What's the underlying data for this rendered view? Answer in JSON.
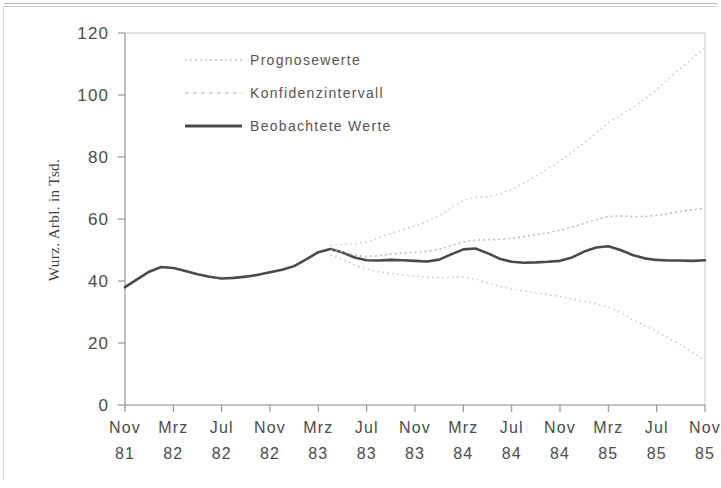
{
  "chart_data": {
    "type": "line",
    "title": "",
    "xlabel": "",
    "ylabel": "Wurz. Arbl. in Tsd.",
    "ylim": [
      0,
      120
    ],
    "yticks": [
      0,
      20,
      40,
      60,
      80,
      100,
      120
    ],
    "ytick_labels": [
      "0",
      "20",
      "40",
      "60",
      "80",
      "100",
      "120"
    ],
    "grid": false,
    "legend_position": "top-left-inside",
    "x_tick_months": [
      "Nov",
      "Mrz",
      "Jul",
      "Nov",
      "Mrz",
      "Jul",
      "Nov",
      "Mrz",
      "Jul",
      "Nov",
      "Mrz",
      "Jul",
      "Nov"
    ],
    "x_tick_years": [
      "81",
      "82",
      "82",
      "82",
      "83",
      "83",
      "83",
      "84",
      "84",
      "84",
      "85",
      "85",
      "85"
    ],
    "x": [
      "Nov 81",
      "Dez 81",
      "Jan 82",
      "Feb 82",
      "Mrz 82",
      "Apr 82",
      "Mai 82",
      "Jun 82",
      "Jul 82",
      "Aug 82",
      "Sep 82",
      "Okt 82",
      "Nov 82",
      "Dez 82",
      "Jan 83",
      "Feb 83",
      "Mrz 83",
      "Apr 83",
      "Mai 83",
      "Jun 83",
      "Jul 83",
      "Aug 83",
      "Sep 83",
      "Okt 83",
      "Nov 83",
      "Dez 83",
      "Jan 84",
      "Feb 84",
      "Mrz 84",
      "Apr 84",
      "Mai 84",
      "Jun 84",
      "Jul 84",
      "Aug 84",
      "Sep 84",
      "Okt 84",
      "Nov 84",
      "Dez 84",
      "Jan 85",
      "Feb 85",
      "Mrz 85",
      "Apr 85",
      "Mai 85",
      "Jun 85",
      "Jul 85",
      "Aug 85",
      "Sep 85",
      "Okt 85",
      "Nov 85"
    ],
    "series": [
      {
        "name": "Beobachtete Werte",
        "style": "solid",
        "color": "#4a4a4a",
        "values": [
          38.0,
          40.5,
          43.0,
          44.5,
          44.2,
          43.2,
          42.2,
          41.4,
          40.8,
          41.0,
          41.4,
          42.0,
          42.8,
          43.6,
          44.8,
          47.0,
          49.3,
          50.3,
          49.2,
          47.6,
          46.7,
          46.6,
          46.8,
          46.7,
          46.5,
          46.3,
          46.9,
          48.6,
          50.2,
          50.5,
          49.0,
          47.2,
          46.2,
          45.9,
          46.0,
          46.2,
          46.5,
          47.6,
          49.5,
          50.8,
          51.2,
          50.0,
          48.4,
          47.3,
          46.8,
          46.6,
          46.6,
          46.5,
          46.7
        ]
      },
      {
        "name": "Prognosewerte",
        "style": "dotted",
        "color": "#b9b9b9",
        "start_index": 17,
        "values": [
          null,
          null,
          null,
          null,
          null,
          null,
          null,
          null,
          null,
          null,
          null,
          null,
          null,
          null,
          null,
          null,
          null,
          50.0,
          49.4,
          48.4,
          47.9,
          48.2,
          48.7,
          49.0,
          49.3,
          49.6,
          50.2,
          51.4,
          52.6,
          53.2,
          53.3,
          53.4,
          53.8,
          54.3,
          54.9,
          55.6,
          56.4,
          57.4,
          58.6,
          59.8,
          60.8,
          61.0,
          60.8,
          60.8,
          61.2,
          61.8,
          62.4,
          63.0,
          63.5
        ]
      },
      {
        "name": "Konfidenzintervall oben",
        "style": "dotted",
        "color": "#c6c6c6",
        "start_index": 17,
        "values": [
          null,
          null,
          null,
          null,
          null,
          null,
          null,
          null,
          null,
          null,
          null,
          null,
          null,
          null,
          null,
          null,
          null,
          51.5,
          51.8,
          52.0,
          52.6,
          54.0,
          55.4,
          56.6,
          57.8,
          59.2,
          61.0,
          63.6,
          66.0,
          67.0,
          67.2,
          68.0,
          69.6,
          71.6,
          73.8,
          76.2,
          78.8,
          81.6,
          84.6,
          87.8,
          91.0,
          93.5,
          95.8,
          98.6,
          101.8,
          105.2,
          108.6,
          112.0,
          115.2
        ]
      },
      {
        "name": "Konfidenzintervall unten",
        "style": "dotted",
        "color": "#c6c6c6",
        "start_index": 17,
        "values": [
          null,
          null,
          null,
          null,
          null,
          null,
          null,
          null,
          null,
          null,
          null,
          null,
          null,
          null,
          null,
          null,
          null,
          48.4,
          47.0,
          45.2,
          43.8,
          43.0,
          42.4,
          42.0,
          41.6,
          41.2,
          41.0,
          41.2,
          41.4,
          40.6,
          39.4,
          38.2,
          37.4,
          36.8,
          36.2,
          35.6,
          35.0,
          34.2,
          33.4,
          32.6,
          31.6,
          29.8,
          27.6,
          25.6,
          23.6,
          21.6,
          19.4,
          17.0,
          14.2
        ]
      }
    ],
    "legend": [
      {
        "label": "Prognosewerte",
        "style": "dotted",
        "color": "#b9b9b9"
      },
      {
        "label": "Konfidenzintervall",
        "style": "dashed",
        "color": "#c8c8c8"
      },
      {
        "label": "Beobachtete Werte",
        "style": "solid",
        "color": "#4a4a4a"
      }
    ]
  }
}
